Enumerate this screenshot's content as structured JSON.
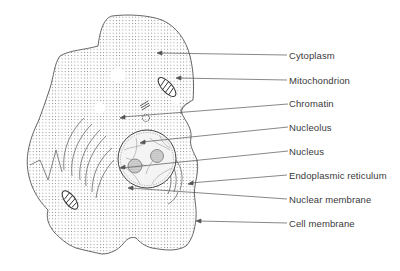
{
  "diagram": {
    "type": "labeled-illustration",
    "colors": {
      "line": "#555555",
      "text": "#3a3a3a",
      "stipple": "#8a8a8a",
      "background": "#ffffff"
    },
    "labels": [
      {
        "id": "cytoplasm",
        "text": "Cytoplasm",
        "y": 55,
        "from": [
          158,
          53
        ],
        "to": [
          287,
          55
        ]
      },
      {
        "id": "mitochondrion",
        "text": "Mitochondrion",
        "y": 80,
        "from": [
          178,
          78
        ],
        "to": [
          287,
          80
        ]
      },
      {
        "id": "chromatin",
        "text": "Chromatin",
        "y": 104,
        "from": [
          122,
          117
        ],
        "to": [
          288,
          104
        ]
      },
      {
        "id": "nucleolus",
        "text": "Nucleolus",
        "y": 127,
        "from": [
          142,
          142
        ],
        "to": [
          288,
          127
        ]
      },
      {
        "id": "nucleus",
        "text": "Nucleus",
        "y": 151,
        "from": [
          122,
          168
        ],
        "to": [
          288,
          151
        ]
      },
      {
        "id": "endoplasmic-reticulum",
        "text": "Endoplasmic reticulum",
        "y": 175,
        "from": [
          190,
          183
        ],
        "to": [
          287,
          175
        ]
      },
      {
        "id": "nuclear-membrane",
        "text": "Nuclear membrane",
        "y": 199,
        "from": [
          130,
          188
        ],
        "to": [
          287,
          199
        ]
      },
      {
        "id": "cell-membrane",
        "text": "Cell membrane",
        "y": 223,
        "from": [
          196,
          221
        ],
        "to": [
          287,
          223
        ]
      }
    ]
  }
}
